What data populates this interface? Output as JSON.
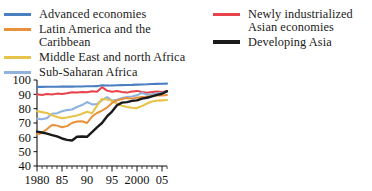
{
  "legend": {
    "left_column": [
      {
        "label": "Advanced economies",
        "color": "#4a7fc1",
        "icon": "line-swatch-icon",
        "thick": false
      },
      {
        "label": "Latin America and the Caribbean",
        "color": "#e8913a",
        "icon": "line-swatch-icon",
        "thick": false
      },
      {
        "label": "Middle East and north Africa",
        "color": "#e8c34a",
        "icon": "line-swatch-icon",
        "thick": false
      },
      {
        "label": "Sub-Saharan Africa",
        "color": "#8fb3de",
        "icon": "line-swatch-icon",
        "thick": false
      }
    ],
    "right_column": [
      {
        "label": "Newly industrialized Asian economies",
        "color": "#e8434a",
        "icon": "line-swatch-icon",
        "thick": false
      },
      {
        "label": "Developing Asia",
        "color": "#1a1a1a",
        "icon": "line-swatch-icon",
        "thick": true
      }
    ]
  },
  "axes": {
    "y_ticks": [
      "100",
      "90",
      "80",
      "70",
      "60",
      "50",
      "40"
    ],
    "x_ticks": [
      "1980",
      "85",
      "90",
      "95",
      "2000",
      "05"
    ]
  },
  "chart_data": {
    "type": "line",
    "title": "",
    "subtitle": "",
    "xlabel": "",
    "ylabel": "",
    "xlim": [
      1980,
      2006
    ],
    "ylim": [
      40,
      100
    ],
    "y_tick_values": [
      40,
      50,
      60,
      70,
      80,
      90,
      100
    ],
    "x_tick_values": [
      1980,
      1985,
      1990,
      1995,
      2000,
      2005
    ],
    "x_minor_tick_step": 1,
    "grid": false,
    "legend_position": "top",
    "x": [
      1980,
      1981,
      1982,
      1983,
      1984,
      1985,
      1986,
      1987,
      1988,
      1989,
      1990,
      1991,
      1992,
      1993,
      1994,
      1995,
      1996,
      1997,
      1998,
      1999,
      2000,
      2001,
      2002,
      2003,
      2004,
      2005,
      2006
    ],
    "series": [
      {
        "name": "Advanced economies",
        "color": "#4a7fc1",
        "values": [
          95.2,
          95.2,
          95.3,
          95.3,
          95.3,
          95.4,
          95.4,
          95.4,
          95.5,
          95.5,
          95.6,
          95.6,
          95.7,
          96.3,
          96.2,
          96.2,
          96.3,
          96.4,
          96.5,
          96.6,
          96.8,
          96.9,
          97.0,
          97.2,
          97.3,
          97.4,
          97.5
        ]
      },
      {
        "name": "Newly industrialized Asian economies",
        "color": "#e8434a",
        "values": [
          90.0,
          89.6,
          90.2,
          89.9,
          90.5,
          90.2,
          90.8,
          91.5,
          91.2,
          91.6,
          91.5,
          92.1,
          91.8,
          95.0,
          92.6,
          91.8,
          92.3,
          91.7,
          91.2,
          92.0,
          92.4,
          91.6,
          91.1,
          91.6,
          92.0,
          91.6,
          92.1
        ]
      },
      {
        "name": "Sub-Saharan Africa",
        "color": "#8fb3de",
        "values": [
          73.0,
          72.6,
          73.4,
          76.5,
          76.8,
          78.2,
          79.0,
          79.4,
          81.2,
          82.5,
          84.6,
          83.0,
          83.2,
          86.0,
          88.0,
          85.6,
          86.2,
          87.4,
          88.2,
          88.5,
          89.3,
          91.0,
          89.7,
          90.0,
          90.6,
          91.0,
          91.6
        ]
      },
      {
        "name": "Middle East and north Africa",
        "color": "#e8c34a",
        "values": [
          78.2,
          77.6,
          77.0,
          75.4,
          74.2,
          73.4,
          73.8,
          74.6,
          75.2,
          76.4,
          77.8,
          76.8,
          82.0,
          86.8,
          86.4,
          85.5,
          83.6,
          82.0,
          81.2,
          80.6,
          80.4,
          81.8,
          83.6,
          85.0,
          85.6,
          85.8,
          86.0
        ]
      },
      {
        "name": "Latin America and the Caribbean",
        "color": "#e8913a",
        "values": [
          62.2,
          63.0,
          65.8,
          68.6,
          68.2,
          67.0,
          67.8,
          70.0,
          71.0,
          71.2,
          70.0,
          74.5,
          77.0,
          78.6,
          80.8,
          84.0,
          85.8,
          86.8,
          87.5,
          87.0,
          87.6,
          88.2,
          88.4,
          88.8,
          89.4,
          89.2,
          89.6
        ]
      },
      {
        "name": "Developing Asia",
        "color": "#1a1a1a",
        "values": [
          64.0,
          63.4,
          62.6,
          61.6,
          60.6,
          59.2,
          58.2,
          57.8,
          60.4,
          60.6,
          60.4,
          63.6,
          67.0,
          70.0,
          74.6,
          78.0,
          82.4,
          84.2,
          84.6,
          85.4,
          85.8,
          87.0,
          87.6,
          88.6,
          89.6,
          90.4,
          92.2
        ]
      }
    ]
  }
}
